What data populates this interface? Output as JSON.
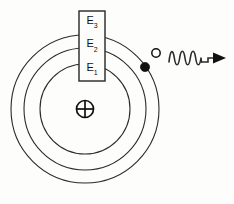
{
  "figure": {
    "background_color": "#fdfdfb",
    "line_color": "#2b2b2b"
  },
  "nucleus": {
    "symbol_name": "positive-charge-nucleus-icon",
    "symbol": "⊕",
    "charge_sign": "+",
    "center_x": 85,
    "center_y": 109,
    "radius": 8.5
  },
  "level_box": {
    "x": 79,
    "y": 11,
    "width": 26,
    "height": 70,
    "levels": [
      {
        "key": "E3",
        "label": "E",
        "sub": "3",
        "orbit_index": 3,
        "y": 30
      },
      {
        "key": "E2",
        "label": "E",
        "sub": "2",
        "orbit_index": 2,
        "y": 50
      },
      {
        "key": "E1",
        "label": "E",
        "sub": "1",
        "orbit_index": 1,
        "y": 68
      }
    ]
  },
  "orbits": [
    {
      "name": "orbit-1-inner",
      "level": "E1",
      "radius": 45,
      "stroke": "#2b2b2b"
    },
    {
      "name": "orbit-2-middle",
      "level": "E2",
      "radius": 61,
      "stroke": "#2b2b2b"
    },
    {
      "name": "orbit-3-outer",
      "level": "E3",
      "radius": 74,
      "stroke": "#2b2b2b"
    }
  ],
  "electrons": [
    {
      "name": "electron-excited-filled",
      "state": "filled",
      "on_orbit": "orbit-2-middle",
      "fill": "#111111",
      "cx": 145,
      "cy": 67,
      "r": 4.6
    },
    {
      "name": "electron-vacancy-hollow",
      "state": "hollow",
      "on_orbit": "orbit-3-outer",
      "fill": "#fdfdfb",
      "cx": 156,
      "cy": 53,
      "r": 4.2
    }
  ],
  "photon": {
    "name": "emitted-photon-wave",
    "cycles": 3,
    "wave_start_x": 169,
    "wave_end_x": 201,
    "baseline_y": 58,
    "amplitude": 9,
    "arrow_tip_x": 226,
    "arrow_label": "",
    "stroke": "#2b2b2b"
  },
  "annotations": {
    "level_labels": [
      "E3",
      "E2",
      "E1"
    ],
    "level_labels_display": [
      "E₃",
      "E₂",
      "E₁"
    ]
  }
}
